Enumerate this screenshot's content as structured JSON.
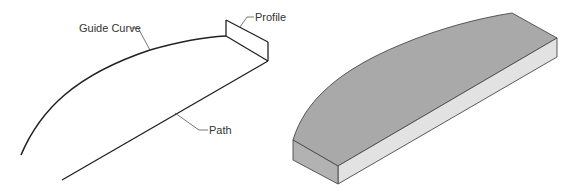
{
  "diagram": {
    "left_panel": {
      "labels": {
        "guide_curve": "Guide Curve",
        "profile": "Profile",
        "path": "Path"
      }
    },
    "right_panel": {
      "description": "Swept solid result"
    },
    "colors": {
      "line": "#222222",
      "leader": "#555555",
      "label_text": "#333333",
      "top_face": "#a9a9a9",
      "front_face": "#e2e2e2",
      "end_face": "#b2b2b2",
      "edge": "#4a4a4a"
    }
  }
}
